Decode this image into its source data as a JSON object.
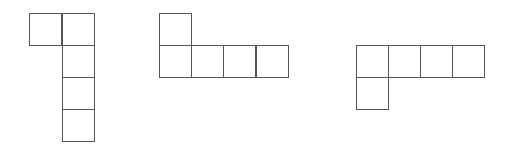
{
  "figure": {
    "line_color": "#555555",
    "background": "#ffffff",
    "cell_size": 33,
    "shapes": [
      {
        "name": "shape-1",
        "cells": [
          {
            "x": 29,
            "y": 13
          },
          {
            "x": 62,
            "y": 13
          },
          {
            "x": 62,
            "y": 45
          },
          {
            "x": 62,
            "y": 77
          },
          {
            "x": 62,
            "y": 109
          }
        ]
      },
      {
        "name": "shape-2",
        "cells": [
          {
            "x": 159,
            "y": 13
          },
          {
            "x": 159,
            "y": 45
          },
          {
            "x": 191,
            "y": 45
          },
          {
            "x": 223,
            "y": 45
          },
          {
            "x": 256,
            "y": 45
          }
        ]
      },
      {
        "name": "shape-3",
        "cells": [
          {
            "x": 356,
            "y": 45
          },
          {
            "x": 388,
            "y": 45
          },
          {
            "x": 420,
            "y": 45
          },
          {
            "x": 452,
            "y": 45
          },
          {
            "x": 356,
            "y": 77
          }
        ]
      }
    ]
  }
}
